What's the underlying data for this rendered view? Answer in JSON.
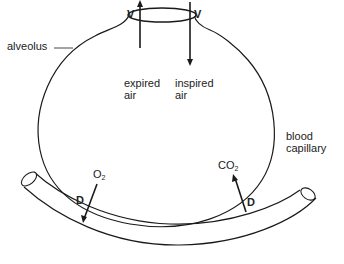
{
  "diagram": {
    "labels": {
      "alveolus": "alveolus",
      "ventilation_out": "V",
      "ventilation_in": "V",
      "expired_line1": "expired",
      "expired_line2": "air",
      "inspired_line1": "inspired",
      "inspired_line2": "air",
      "blood_line1": "blood",
      "blood_line2": "capillary",
      "o2_base": "O",
      "o2_sub": "2",
      "co2_base": "CO",
      "co2_sub": "2",
      "diffusion_left": "D",
      "diffusion_right": "D"
    },
    "colors": {
      "line": "#1a1a1a",
      "background": "#ffffff"
    }
  }
}
